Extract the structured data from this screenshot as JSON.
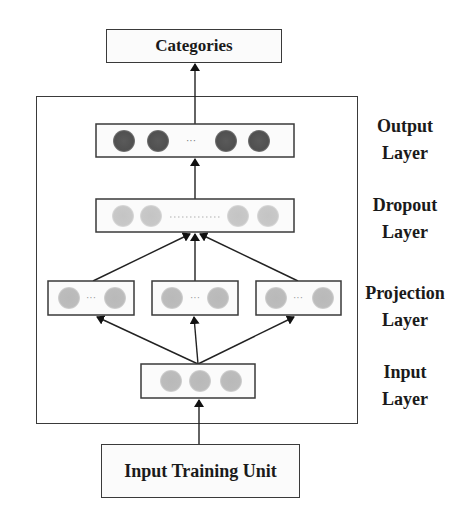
{
  "top_box": {
    "label": "Categories"
  },
  "bottom_box": {
    "label": "Input Training Unit"
  },
  "layers": [
    {
      "id": "output",
      "label_line1": "Output",
      "label_line2": "Layer",
      "node_color": "#555555",
      "ellipsis": "···"
    },
    {
      "id": "dropout",
      "label_line1": "Dropout",
      "label_line2": "Layer",
      "node_color": "#c9c9c9",
      "ellipsis": "············"
    },
    {
      "id": "projection",
      "label_line1": "Projection",
      "label_line2": "Layer",
      "node_color": "#bdbdbd",
      "ellipsis": "···"
    },
    {
      "id": "input",
      "label_line1": "Input",
      "label_line2": "Layer",
      "node_color": "#b5b5b5"
    }
  ]
}
